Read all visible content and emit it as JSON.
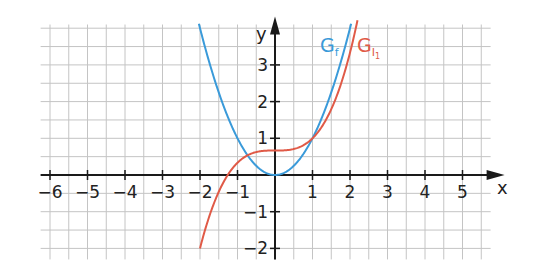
{
  "chart_data": {
    "type": "line",
    "title": "",
    "xlabel": "x",
    "ylabel": "y",
    "xlim": [
      -6.25,
      5.75
    ],
    "ylim": [
      -2.3,
      4.1
    ],
    "grid": true,
    "grid_step": 0.5,
    "x_ticks": [
      -6,
      -5,
      -4,
      -3,
      -2,
      -1,
      1,
      2,
      3,
      4,
      5
    ],
    "x_tick_labels": [
      "−6",
      "−5",
      "−4",
      "−3",
      "−2",
      "−1",
      "1",
      "2",
      "3",
      "4",
      "5"
    ],
    "y_ticks": [
      -2,
      -1,
      1,
      2,
      3
    ],
    "y_tick_labels": [
      "−2",
      "−1",
      "1",
      "2",
      "3"
    ],
    "series": [
      {
        "name": "G_f",
        "label_main": "G",
        "label_sub": "f",
        "color": "#3a9ad9",
        "formula": "y = x^2",
        "x": [
          -2.03,
          -1.5,
          -1.0,
          -0.5,
          0.0,
          0.5,
          1.0,
          1.5,
          2.03
        ],
        "y": [
          4.1,
          2.25,
          1.0,
          0.25,
          0.0,
          0.25,
          1.0,
          2.25,
          4.1
        ]
      },
      {
        "name": "G_I1",
        "label_main": "G",
        "label_sub": "I",
        "label_subsub": "1",
        "color": "#e05a47",
        "formula": "y = x^3/3 + 2/3",
        "x": [
          -2.0,
          -1.5,
          -1.26,
          -1.0,
          -0.5,
          0.0,
          0.5,
          1.0,
          1.5,
          2.0,
          2.2
        ],
        "y": [
          -2.0,
          -0.46,
          0.0,
          0.33,
          0.63,
          0.67,
          0.71,
          1.0,
          1.79,
          3.33,
          4.1
        ]
      }
    ]
  },
  "axes": {
    "x_label": "x",
    "y_label": "y"
  },
  "legend": {
    "f_main": "G",
    "f_sub": "f",
    "i_main": "G",
    "i_sub": "I",
    "i_subsub": "1"
  }
}
